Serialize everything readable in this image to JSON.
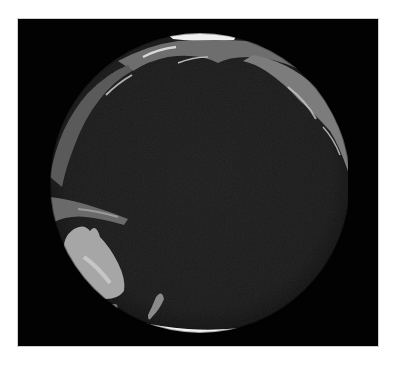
{
  "image": {
    "description": "Satellite composite view of Earth centered on the Pacific Ocean",
    "background_color": "#ffffff",
    "frame_color": "#020202",
    "ocean_color": "#1a1a1a",
    "land_color": "#8a8a8a",
    "ice_color": "#f4f4f4",
    "features": [
      {
        "name": "Pacific Ocean",
        "position": "center"
      },
      {
        "name": "Australia",
        "position": "lower-left"
      },
      {
        "name": "New Zealand",
        "position": "lower-left-center"
      },
      {
        "name": "Indonesia / Papua New Guinea",
        "position": "left"
      },
      {
        "name": "East Asia / Japan",
        "position": "upper-left edge"
      },
      {
        "name": "Alaska / Bering region",
        "position": "top"
      },
      {
        "name": "North America west coast",
        "position": "upper-right"
      },
      {
        "name": "Arctic ice cap",
        "position": "top edge"
      },
      {
        "name": "Antarctica",
        "position": "bottom edge"
      }
    ]
  }
}
